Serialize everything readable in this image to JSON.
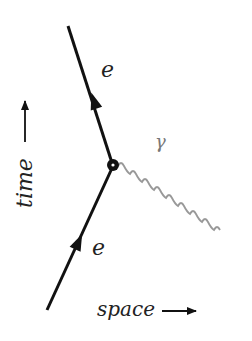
{
  "diagram": {
    "type": "feynman",
    "title": "",
    "particles": {
      "incoming_electron": {
        "label": "e"
      },
      "outgoing_electron": {
        "label": "e"
      },
      "photon": {
        "label": "γ"
      }
    },
    "axes": {
      "time_label": "time",
      "space_label": "space"
    },
    "colors": {
      "fermion_line": "#111111",
      "photon_line": "#999999",
      "text": "#222222",
      "gamma_text": "#777777"
    }
  }
}
